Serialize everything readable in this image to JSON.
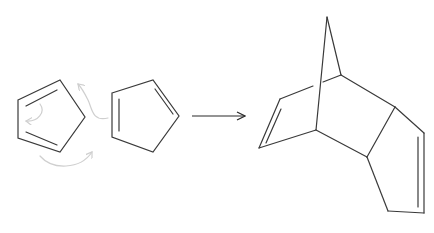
{
  "diagram": {
    "type": "chemical-reaction",
    "reaction": "Diels-Alder dimerization",
    "colors": {
      "bond": "#3a3a3a",
      "curly_arrow": "#cfcfcf",
      "reaction_arrow": "#2a2a2a",
      "background": "#ffffff"
    },
    "reactants": [
      {
        "id": "diene",
        "label": "cyclopentadiene (diene)",
        "vertices": [
          [
            18,
            100
          ],
          [
            60,
            80
          ],
          [
            85,
            117
          ],
          [
            60,
            152
          ],
          [
            18,
            138
          ]
        ],
        "double_bonds": [
          [
            [
              26,
              106
            ],
            [
              57,
              90
            ]
          ],
          [
            [
              26,
              132
            ],
            [
              57,
              145
            ]
          ]
        ]
      },
      {
        "id": "dienophile",
        "label": "cyclopentadiene (dienophile)",
        "vertices": [
          [
            112,
            93
          ],
          [
            153,
            80
          ],
          [
            179,
            116
          ],
          [
            153,
            152
          ],
          [
            112,
            137
          ]
        ],
        "double_bonds": [
          [
            [
              119,
              99
            ],
            [
              119,
              131
            ]
          ],
          [
            [
              155,
              89
            ],
            [
              173,
              114
            ]
          ]
        ]
      }
    ],
    "curly_arrows": [
      {
        "id": "curly-1",
        "path": "M40 104 C 46 112, 38 122, 26 121"
      },
      {
        "id": "curly-2",
        "path": "M108 118 C 92 122, 92 108, 88 100 C 84 92, 82 88, 78 84"
      },
      {
        "id": "curly-3",
        "path": "M40 156 C 52 170, 80 170, 92 152"
      }
    ],
    "reaction_arrow": {
      "x1": 192,
      "y1": 116,
      "x2": 245,
      "y2": 116
    },
    "product": {
      "id": "dicyclopentadiene",
      "label": "dicyclopentadiene (endo adduct)",
      "bonds": [
        [
          [
            327,
            17
          ],
          [
            341,
            75
          ]
        ],
        [
          [
            327,
            17
          ],
          [
            316,
            130
          ]
        ],
        [
          [
            280,
            99
          ],
          [
            313,
            86
          ]
        ],
        [
          [
            323,
            82
          ],
          [
            341,
            75
          ]
        ],
        [
          [
            280,
            99
          ],
          [
            259,
            148
          ]
        ],
        [
          [
            259,
            148
          ],
          [
            316,
            130
          ]
        ],
        [
          [
            341,
            75
          ],
          [
            395,
            107
          ]
        ],
        [
          [
            316,
            130
          ],
          [
            367,
            157
          ]
        ],
        [
          [
            367,
            157
          ],
          [
            395,
            107
          ]
        ],
        [
          [
            395,
            107
          ],
          [
            424,
            133
          ]
        ],
        [
          [
            424,
            133
          ],
          [
            424,
            213
          ]
        ],
        [
          [
            424,
            213
          ],
          [
            388,
            211
          ]
        ],
        [
          [
            388,
            211
          ],
          [
            367,
            157
          ]
        ]
      ],
      "double_bonds": [
        [
          [
            281,
            109
          ],
          [
            266,
            143
          ]
        ],
        [
          [
            418,
            137
          ],
          [
            418,
            207
          ]
        ]
      ]
    }
  }
}
